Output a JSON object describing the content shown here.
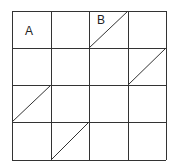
{
  "diagram": {
    "rows": 4,
    "cols": 4,
    "grid_color": "#333333",
    "labels": [
      {
        "text": "A",
        "row": 0,
        "col": 0
      },
      {
        "text": "B",
        "row": 0,
        "col": 2
      }
    ],
    "diagonals": [
      {
        "row": 0,
        "col": 2,
        "direction": "bottom-left-to-top-right"
      },
      {
        "row": 1,
        "col": 3,
        "direction": "bottom-left-to-top-right"
      },
      {
        "row": 2,
        "col": 0,
        "direction": "bottom-left-to-top-right"
      },
      {
        "row": 3,
        "col": 1,
        "direction": "bottom-left-to-top-right"
      }
    ]
  }
}
